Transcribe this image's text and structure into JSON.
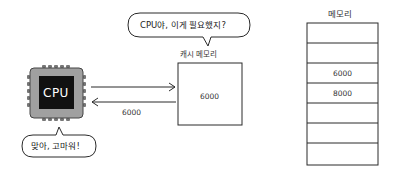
{
  "speech_top": {
    "text": "CPU야, 이게 필요했지?"
  },
  "speech_bottom": {
    "text": "맞아, 고마워!"
  },
  "cpu": {
    "label": "CPU"
  },
  "cache": {
    "label": "캐시 메모리",
    "value": "6000"
  },
  "arrows": {
    "request_label": "",
    "response_label": "6000"
  },
  "memory": {
    "label": "메모리",
    "rows": [
      "",
      "",
      "6000",
      "8000",
      "",
      "",
      ""
    ]
  },
  "colors": {
    "chip_body": "#9a9a9a",
    "chip_core": "#111111",
    "line": "#2a2a2a"
  }
}
